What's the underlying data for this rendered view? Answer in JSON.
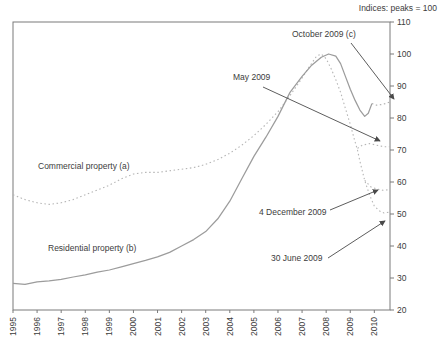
{
  "chart_data": {
    "type": "line",
    "note": "Indices: peaks = 100",
    "x_axis": {
      "ticks": [
        1995,
        1996,
        1997,
        1998,
        1999,
        2000,
        2001,
        2002,
        2003,
        2004,
        2005,
        2006,
        2007,
        2008,
        2009,
        2010
      ],
      "label_rotation": "vertical"
    },
    "y_axis": {
      "min": 20,
      "max": 110,
      "step": 10,
      "side": "right",
      "ticks": [
        110,
        100,
        90,
        80,
        70,
        60,
        50,
        40,
        30,
        20
      ]
    },
    "grid": false,
    "legend_position": "in-plot-labels",
    "colors": {
      "axis": "#7a7a7a",
      "text": "#3c3c3c",
      "arrow": "#4a4a4a",
      "residential": "#9c9c9c",
      "commercial": "#b5b5b5"
    },
    "series_labels": {
      "commercial": "Commercial property (a)",
      "residential": "Residential property (b)"
    },
    "series": [
      {
        "id": "commercial-property",
        "name": "Commercial property (a)",
        "style": "dotted",
        "color": "#b5b5b5",
        "width": 1.1,
        "points": [
          [
            1995,
            56.0
          ],
          [
            1995.5,
            54.5
          ],
          [
            1996,
            53.5
          ],
          [
            1996.5,
            53.0
          ],
          [
            1997,
            53.5
          ],
          [
            1997.5,
            54.5
          ],
          [
            1998,
            56.0
          ],
          [
            1998.5,
            57.5
          ],
          [
            1999,
            59.0
          ],
          [
            1999.5,
            61.0
          ],
          [
            2000,
            62.5
          ],
          [
            2000.5,
            63.0
          ],
          [
            2001,
            63.0
          ],
          [
            2001.5,
            63.5
          ],
          [
            2002,
            64.0
          ],
          [
            2002.5,
            64.5
          ],
          [
            2003,
            65.5
          ],
          [
            2003.5,
            67.0
          ],
          [
            2004,
            69.0
          ],
          [
            2004.5,
            71.5
          ],
          [
            2005,
            74.5
          ],
          [
            2005.5,
            78.0
          ],
          [
            2006,
            82.0
          ],
          [
            2006.5,
            87.0
          ],
          [
            2007,
            92.5
          ],
          [
            2007.3,
            96.0
          ],
          [
            2007.6,
            99.3
          ],
          [
            2007.8,
            100.0
          ],
          [
            2008.0,
            98.5
          ],
          [
            2008.2,
            95.5
          ],
          [
            2008.4,
            92.0
          ],
          [
            2008.6,
            88.0
          ],
          [
            2008.8,
            83.0
          ],
          [
            2009.0,
            78.0
          ],
          [
            2009.2,
            72.5
          ],
          [
            2009.3,
            70.0
          ],
          [
            2009.4,
            66.5
          ],
          [
            2009.6,
            60.5
          ],
          [
            2009.8,
            56.0
          ],
          [
            2010.0,
            52.5
          ],
          [
            2010.2,
            51.0
          ],
          [
            2010.4,
            50.3
          ],
          [
            2010.65,
            50.6
          ]
        ]
      },
      {
        "id": "commercial-may-2009-branch",
        "name": "May 2009",
        "style": "dotted",
        "color": "#b5b5b5",
        "width": 1.1,
        "points": [
          [
            2009.3,
            70.5
          ],
          [
            2009.5,
            71.5
          ],
          [
            2009.8,
            72.0
          ],
          [
            2010.1,
            71.5
          ],
          [
            2010.4,
            71.0
          ],
          [
            2010.65,
            71.0
          ]
        ]
      },
      {
        "id": "commercial-4-december-2009-branch",
        "name": "4 December 2009",
        "style": "dotted",
        "color": "#b5b5b5",
        "width": 1.1,
        "points": [
          [
            2009.6,
            60.5
          ],
          [
            2009.85,
            58.5
          ],
          [
            2010.1,
            57.8
          ],
          [
            2010.35,
            57.4
          ],
          [
            2010.65,
            57.6
          ]
        ]
      },
      {
        "id": "residential-property",
        "name": "Residential property (b)",
        "style": "solid",
        "color": "#9c9c9c",
        "width": 1.25,
        "points": [
          [
            1995,
            28.3
          ],
          [
            1995.5,
            28.0
          ],
          [
            1996,
            28.8
          ],
          [
            1996.5,
            29.1
          ],
          [
            1997,
            29.6
          ],
          [
            1997.5,
            30.3
          ],
          [
            1998,
            31.0
          ],
          [
            1998.5,
            31.8
          ],
          [
            1999,
            32.5
          ],
          [
            1999.5,
            33.5
          ],
          [
            2000,
            34.5
          ],
          [
            2000.5,
            35.5
          ],
          [
            2001,
            36.6
          ],
          [
            2001.5,
            38.0
          ],
          [
            2002,
            40.0
          ],
          [
            2002.5,
            42.0
          ],
          [
            2003,
            44.5
          ],
          [
            2003.5,
            48.5
          ],
          [
            2004,
            54.0
          ],
          [
            2004.5,
            61.0
          ],
          [
            2005,
            68.0
          ],
          [
            2005.5,
            74.0
          ],
          [
            2006,
            80.5
          ],
          [
            2006.5,
            88.0
          ],
          [
            2007,
            93.0
          ],
          [
            2007.4,
            96.5
          ],
          [
            2007.8,
            99.0
          ],
          [
            2008.1,
            100.0
          ],
          [
            2008.4,
            99.3
          ],
          [
            2008.6,
            97.0
          ],
          [
            2008.8,
            93.0
          ],
          [
            2009.0,
            89.0
          ],
          [
            2009.2,
            85.5
          ],
          [
            2009.4,
            82.5
          ],
          [
            2009.6,
            80.5
          ],
          [
            2009.75,
            81.5
          ],
          [
            2009.9,
            84.5
          ]
        ]
      },
      {
        "id": "residential-latest-dotted-tail",
        "name": "October 2009 (c)",
        "style": "dotted",
        "color": "#adadad",
        "width": 1.1,
        "points": [
          [
            2009.9,
            84.5
          ],
          [
            2010.1,
            84.0
          ],
          [
            2010.3,
            84.2
          ],
          [
            2010.5,
            84.6
          ],
          [
            2010.65,
            85.0
          ]
        ]
      }
    ],
    "annotations": [
      {
        "text": "October 2009 (c)",
        "arrow": [
          351,
          43,
          394,
          99
        ]
      },
      {
        "text": "May 2009",
        "arrow": [
          263,
          87,
          380,
          141
        ]
      },
      {
        "text": "4 December 2009",
        "arrow": [
          330,
          210,
          378,
          190
        ]
      },
      {
        "text": "30 June 2009",
        "arrow": [
          328,
          258,
          385,
          221
        ]
      }
    ],
    "layout": {
      "plot": {
        "left": 13,
        "top": 22,
        "right": 390,
        "bottom": 310
      },
      "x_min": 1995,
      "x_max": 2010.65
    }
  }
}
